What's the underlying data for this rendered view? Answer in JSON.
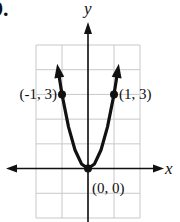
{
  "problem_number": "9.",
  "chart_data": {
    "type": "line",
    "title": "",
    "function": "y = 3x^2",
    "xlabel": "x",
    "ylabel": "y",
    "xlim": [
      -2,
      2
    ],
    "ylim": [
      -2,
      5
    ],
    "grid": true,
    "series": [
      {
        "name": "parabola",
        "x": [
          -1.15,
          -1,
          -0.75,
          -0.5,
          -0.25,
          0,
          0.25,
          0.5,
          0.75,
          1,
          1.15
        ],
        "values": [
          4,
          3,
          1.6875,
          0.75,
          0.1875,
          0,
          0.1875,
          0.75,
          1.6875,
          3,
          4
        ],
        "arrows_at_ends": true
      }
    ],
    "points": [
      {
        "x": -1,
        "y": 3,
        "label": "(-1, 3)"
      },
      {
        "x": 1,
        "y": 3,
        "label": "(1, 3)"
      },
      {
        "x": 0,
        "y": 0,
        "label": "(0, 0)"
      }
    ],
    "colors": {
      "curve": "#111111",
      "grid": "#c8c8c8",
      "axis": "#111111"
    }
  }
}
